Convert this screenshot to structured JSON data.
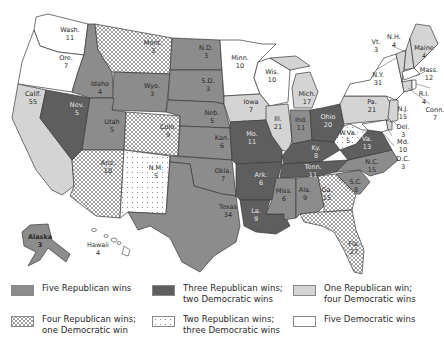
{
  "map": {
    "title": "",
    "colors": {
      "five_rep": "#8c8c8c",
      "three_rep": "#5e5e5e",
      "one_rep": "#d4d4d4",
      "five_dem": "#ffffff",
      "border": "#3a3a3a"
    },
    "states": [
      {
        "abbr": "Wash.",
        "votes": "11",
        "category": "five_dem"
      },
      {
        "abbr": "Ore.",
        "votes": "7",
        "category": "five_dem"
      },
      {
        "abbr": "Calif.",
        "votes": "55",
        "category": "one_rep"
      },
      {
        "abbr": "Nev.",
        "votes": "5",
        "category": "three_rep"
      },
      {
        "abbr": "Idaho",
        "votes": "4",
        "category": "five_rep"
      },
      {
        "abbr": "Mont.",
        "votes": "3",
        "category": "four_rep"
      },
      {
        "abbr": "Wyo.",
        "votes": "3",
        "category": "five_rep"
      },
      {
        "abbr": "Utah",
        "votes": "5",
        "category": "five_rep"
      },
      {
        "abbr": "Colo.",
        "votes": "9",
        "category": "four_rep"
      },
      {
        "abbr": "Ariz.",
        "votes": "10",
        "category": "four_rep"
      },
      {
        "abbr": "N.M.",
        "votes": "5",
        "category": "two_rep"
      },
      {
        "abbr": "N.D.",
        "votes": "3",
        "category": "five_rep"
      },
      {
        "abbr": "S.D.",
        "votes": "3",
        "category": "five_rep"
      },
      {
        "abbr": "Neb.",
        "votes": "5",
        "category": "five_rep"
      },
      {
        "abbr": "Kan.",
        "votes": "6",
        "category": "five_rep"
      },
      {
        "abbr": "Okla.",
        "votes": "7",
        "category": "five_rep"
      },
      {
        "abbr": "Texas",
        "votes": "34",
        "category": "five_rep"
      },
      {
        "abbr": "Minn.",
        "votes": "10",
        "category": "five_dem"
      },
      {
        "abbr": "Iowa",
        "votes": "7",
        "category": "one_rep"
      },
      {
        "abbr": "Mo.",
        "votes": "11",
        "category": "three_rep"
      },
      {
        "abbr": "Ark.",
        "votes": "6",
        "category": "three_rep"
      },
      {
        "abbr": "La.",
        "votes": "9",
        "category": "three_rep"
      },
      {
        "abbr": "Wis.",
        "votes": "10",
        "category": "five_dem"
      },
      {
        "abbr": "Ill.",
        "votes": "21",
        "category": "one_rep"
      },
      {
        "abbr": "Mich.",
        "votes": "17",
        "category": "one_rep"
      },
      {
        "abbr": "Ind.",
        "votes": "11",
        "category": "five_rep"
      },
      {
        "abbr": "Ohio",
        "votes": "20",
        "category": "three_rep"
      },
      {
        "abbr": "Ky.",
        "votes": "8",
        "category": "three_rep"
      },
      {
        "abbr": "Tenn.",
        "votes": "11",
        "category": "three_rep"
      },
      {
        "abbr": "Miss.",
        "votes": "6",
        "category": "five_rep"
      },
      {
        "abbr": "Ala.",
        "votes": "9",
        "category": "five_rep"
      },
      {
        "abbr": "Ga.",
        "votes": "15",
        "category": "four_rep"
      },
      {
        "abbr": "Fla.",
        "votes": "27",
        "category": "four_rep"
      },
      {
        "abbr": "S.C.",
        "votes": "8",
        "category": "five_rep"
      },
      {
        "abbr": "N.C.",
        "votes": "15",
        "category": "five_rep"
      },
      {
        "abbr": "Va.",
        "votes": "13",
        "category": "three_rep"
      },
      {
        "abbr": "W.Va.",
        "votes": "5",
        "category": "two_rep"
      },
      {
        "abbr": "Pa.",
        "votes": "21",
        "category": "one_rep"
      },
      {
        "abbr": "N.Y.",
        "votes": "31",
        "category": "five_dem"
      },
      {
        "abbr": "Vt.",
        "votes": "3",
        "category": "one_rep"
      },
      {
        "abbr": "N.H.",
        "votes": "4",
        "category": "one_rep"
      },
      {
        "abbr": "Maine",
        "votes": "4",
        "category": "one_rep"
      },
      {
        "abbr": "Mass.",
        "votes": "12",
        "category": "five_dem"
      },
      {
        "abbr": "R.I.",
        "votes": "4",
        "category": "five_dem"
      },
      {
        "abbr": "Conn.",
        "votes": "7",
        "category": "one_rep"
      },
      {
        "abbr": "N.J.",
        "votes": "15",
        "category": "one_rep"
      },
      {
        "abbr": "Del.",
        "votes": "3",
        "category": "one_rep"
      },
      {
        "abbr": "Md.",
        "votes": "10",
        "category": "five_dem"
      },
      {
        "abbr": "D.C.",
        "votes": "3",
        "category": "five_dem"
      },
      {
        "abbr": "Alaska",
        "votes": "3",
        "category": "five_rep"
      },
      {
        "abbr": "Hawaii",
        "votes": "4",
        "category": "five_dem"
      }
    ]
  },
  "legend": {
    "items": [
      {
        "key": "five_rep",
        "label": "Five Republican wins"
      },
      {
        "key": "three_rep",
        "label": "Three Republican wins;\ntwo Democratic wins"
      },
      {
        "key": "one_rep",
        "label": "One Republican win;\nfour Democratic wins"
      },
      {
        "key": "four_rep",
        "label": "Four Republican wins;\none Democratic win"
      },
      {
        "key": "two_rep",
        "label": "Two Republican wins;\nthree Democratic wins"
      },
      {
        "key": "five_dem",
        "label": "Five Democratic wins"
      }
    ]
  },
  "labels": {
    "wash_name": "Wash.",
    "wash_v": "11",
    "ore_name": "Ore.",
    "ore_v": "7",
    "calif_name": "Calif.",
    "calif_v": "55",
    "nev_name": "Nev.",
    "nev_v": "5",
    "idaho_name": "Idaho",
    "idaho_v": "4",
    "mont_name": "Mont.",
    "mont_v": "3",
    "wyo_name": "Wyo.",
    "wyo_v": "3",
    "utah_name": "Utah",
    "utah_v": "5",
    "colo_name": "Colo.",
    "colo_v": "9",
    "ariz_name": "Ariz.",
    "ariz_v": "10",
    "nm_name": "N.M.",
    "nm_v": "5",
    "nd_name": "N.D.",
    "nd_v": "3",
    "sd_name": "S.D.",
    "sd_v": "3",
    "neb_name": "Neb.",
    "neb_v": "5",
    "kan_name": "Kan.",
    "kan_v": "6",
    "okla_name": "Okla.",
    "okla_v": "7",
    "texas_name": "Texas",
    "texas_v": "34",
    "minn_name": "Minn.",
    "minn_v": "10",
    "iowa_name": "Iowa",
    "iowa_v": "7",
    "mo_name": "Mo.",
    "mo_v": "11",
    "ark_name": "Ark.",
    "ark_v": "6",
    "la_name": "La.",
    "la_v": "9",
    "wis_name": "Wis.",
    "wis_v": "10",
    "ill_name": "Ill.",
    "ill_v": "21",
    "mich_name": "Mich.",
    "mich_v": "17",
    "ind_name": "Ind.",
    "ind_v": "11",
    "ohio_name": "Ohio",
    "ohio_v": "20",
    "ky_name": "Ky.",
    "ky_v": "8",
    "tenn_name": "Tenn.",
    "tenn_v": "11",
    "miss_name": "Miss.",
    "miss_v": "6",
    "ala_name": "Ala.",
    "ala_v": "9",
    "ga_name": "Ga.",
    "ga_v": "15",
    "fla_name": "Fla.",
    "fla_v": "27",
    "sc_name": "S.C.",
    "sc_v": "8",
    "nc_name": "N.C.",
    "nc_v": "15",
    "va_name": "Va.",
    "va_v": "13",
    "wva_name": "W.Va.",
    "wva_v": "5",
    "pa_name": "Pa.",
    "pa_v": "21",
    "ny_name": "N.Y.",
    "ny_v": "31",
    "vt_name": "Vt.",
    "vt_v": "3",
    "nh_name": "N.H.",
    "nh_v": "4",
    "maine_name": "Maine",
    "maine_v": "4",
    "mass_name": "Mass.",
    "mass_v": "12",
    "ri_name": "R.I.",
    "ri_v": "4",
    "conn_name": "Conn.",
    "conn_v": "7",
    "nj_name": "N.J.",
    "nj_v": "15",
    "del_name": "Del.",
    "del_v": "3",
    "md_name": "Md.",
    "md_v": "10",
    "dc_name": "D.C.",
    "dc_v": "3",
    "alaska_name": "Alaska",
    "alaska_v": "3",
    "hawaii_name": "Hawaii",
    "hawaii_v": "4"
  }
}
